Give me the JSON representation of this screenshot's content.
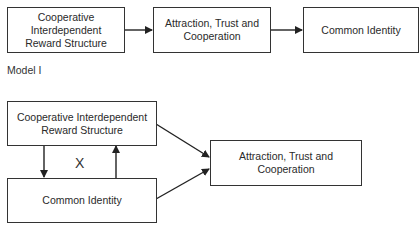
{
  "model1": {
    "boxes": [
      {
        "id": "reward",
        "text": "Cooperative Interdependent Reward Structure"
      },
      {
        "id": "attraction",
        "text": "Attraction, Trust and Cooperation"
      },
      {
        "id": "identity",
        "text": "Common Identity"
      }
    ],
    "caption": "Model I"
  },
  "model2": {
    "boxes": [
      {
        "id": "reward",
        "text": "Cooperative Interdependent Reward Structure"
      },
      {
        "id": "identity",
        "text": "Common Identity"
      },
      {
        "id": "attraction",
        "text": "Attraction, Trust and Cooperation"
      }
    ],
    "x_mark": "X"
  }
}
